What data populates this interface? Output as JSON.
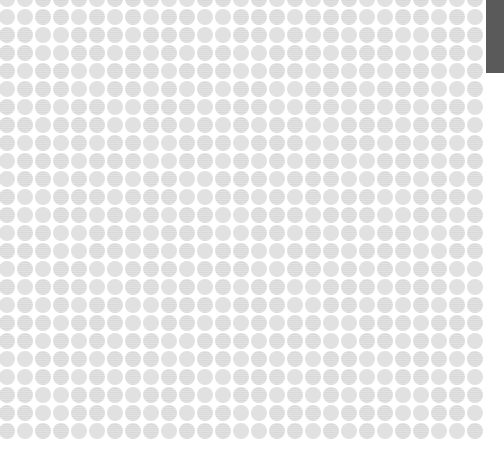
{
  "pattern": {
    "type": "dot-grid",
    "columns": 27,
    "rows": 25,
    "spacing_px": 18,
    "dot_diameter_px": 16,
    "origin_x": 7,
    "origin_y": -1,
    "dot_color": "#e1e1e1",
    "background_color": "#ffffff"
  },
  "scrollbar": {
    "thumb_color": "#5a5a5a",
    "thumb_top": 0,
    "thumb_height": 73
  }
}
